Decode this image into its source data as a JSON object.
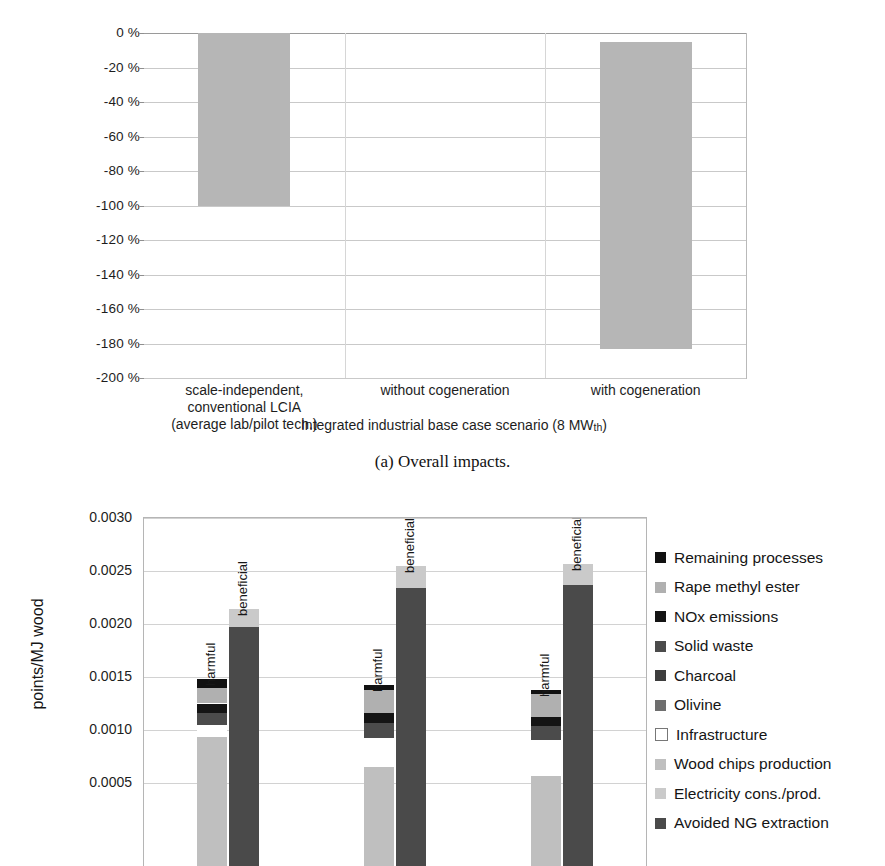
{
  "figure_a": {
    "caption": "(a) Overall impacts.",
    "chart_data": {
      "type": "bar",
      "title": "",
      "xlabel": "Integrated industrial base case scenario (8 MWth)",
      "ylabel": "",
      "ylim": [
        -200,
        0
      ],
      "ytick_labels": [
        "0 %",
        "-20 %",
        "-40 %",
        "-60 %",
        "-80 %",
        "-100 %",
        "-120 %",
        "-140 %",
        "-160 %",
        "-180 %",
        "-200 %"
      ],
      "ytick_values": [
        0,
        -20,
        -40,
        -60,
        -80,
        -100,
        -120,
        -140,
        -160,
        -180,
        -200
      ],
      "grid": true,
      "legend": "none",
      "categories": [
        "scale-independent, conventional LCIA (average lab/pilot tech.)",
        "without cogeneration",
        "with cogeneration"
      ],
      "category_lines": [
        [
          "scale-independent,",
          "conventional LCIA",
          "(average lab/pilot tech.)"
        ],
        [
          "without cogeneration"
        ],
        [
          "with cogeneration"
        ]
      ],
      "values": [
        -100,
        null,
        -183
      ],
      "bar_tops": [
        0,
        null,
        -5
      ],
      "bar_color": "#b6b6b6",
      "xaxis_group_label": "Integrated industrial base case scenario (8 MW",
      "xaxis_group_subscript": "th",
      "xaxis_group_label_end": ")"
    }
  },
  "figure_b": {
    "chart_data": {
      "type": "bar",
      "subtype": "stacked-paired",
      "title": "",
      "ylabel": "points/MJ wood",
      "ylim": [
        0,
        0.003
      ],
      "ytick_labels": [
        "0.0030",
        "0.0025",
        "0.0020",
        "0.0015",
        "0.0010",
        "0.0005"
      ],
      "ytick_values": [
        0.003,
        0.0025,
        0.002,
        0.0015,
        0.001,
        0.0005
      ],
      "grid": true,
      "legend_position": "right",
      "bar_group_labels": [
        "harmful",
        "beneficial"
      ],
      "groups": [
        {
          "harmful_total": 0.00148,
          "beneficial_total": 0.00214,
          "harmful_segments": [
            {
              "name": "Remaining processes",
              "value": 8e-05
            },
            {
              "name": "Rape methyl ester",
              "value": 0.00015
            },
            {
              "name": "NOx emissions",
              "value": 9e-05
            },
            {
              "name": "Solid waste",
              "value": 0.00011
            },
            {
              "name": "Infrastructure",
              "value": 0.00012
            },
            {
              "name": "Wood chips production",
              "value": 0.00093
            }
          ],
          "beneficial_segments": [
            {
              "name": "Electricity cons./prod.",
              "value": 0.00017
            },
            {
              "name": "Avoided NG extraction",
              "value": 0.00197
            }
          ]
        },
        {
          "harmful_total": 0.00142,
          "beneficial_total": 0.00255,
          "harmful_segments": [
            {
              "name": "Remaining processes",
              "value": 4e-05
            },
            {
              "name": "Rape methyl ester",
              "value": 0.00022
            },
            {
              "name": "NOx emissions",
              "value": 9e-05
            },
            {
              "name": "Solid waste",
              "value": 0.00015
            },
            {
              "name": "Infrastructure",
              "value": 0.00027
            },
            {
              "name": "Wood chips production",
              "value": 0.00065
            }
          ],
          "beneficial_segments": [
            {
              "name": "Electricity cons./prod.",
              "value": 0.00021
            },
            {
              "name": "Avoided NG extraction",
              "value": 0.00234
            }
          ]
        },
        {
          "harmful_total": 0.00138,
          "beneficial_total": 0.00257,
          "harmful_segments": [
            {
              "name": "Remaining processes",
              "value": 4e-05
            },
            {
              "name": "Rape methyl ester",
              "value": 0.00022
            },
            {
              "name": "NOx emissions",
              "value": 8e-05
            },
            {
              "name": "Solid waste",
              "value": 0.00013
            },
            {
              "name": "Infrastructure",
              "value": 0.00034
            },
            {
              "name": "Wood chips production",
              "value": 0.00057
            }
          ],
          "beneficial_segments": [
            {
              "name": "Electricity cons./prod.",
              "value": 0.0002
            },
            {
              "name": "Avoided NG extraction",
              "value": 0.00237
            }
          ]
        }
      ],
      "legend": [
        {
          "label": "Remaining processes",
          "color": "#111111"
        },
        {
          "label": "Rape methyl ester",
          "color": "#b0b0b0"
        },
        {
          "label": "NOx emissions",
          "color": "#141414"
        },
        {
          "label": "Solid waste",
          "color": "#4b4b4b"
        },
        {
          "label": "Charcoal",
          "color": "#3d3d3d"
        },
        {
          "label": "Olivine",
          "color": "#6e6e6e"
        },
        {
          "label": "Infrastructure",
          "color": "#ffffff"
        },
        {
          "label": "Wood chips production",
          "color": "#bfbfbf"
        },
        {
          "label": "Electricity cons./prod.",
          "color": "#cacaca"
        },
        {
          "label": "Avoided NG extraction",
          "color": "#4a4a4a"
        }
      ]
    }
  }
}
